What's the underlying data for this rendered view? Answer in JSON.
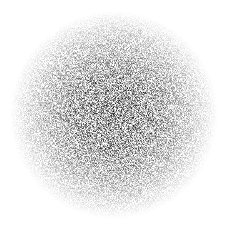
{
  "badge": {
    "value": "14",
    "text_color": "#ffffff",
    "dot_color": "#3a3a3a",
    "background": "#ffffff"
  }
}
